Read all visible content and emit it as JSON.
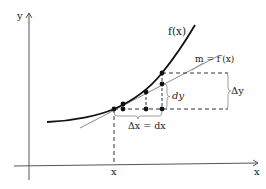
{
  "diagram": {
    "type": "calculus-differential-illustration",
    "axes": {
      "x_label": "x",
      "y_label": "y",
      "x_tick_label": "x"
    },
    "curve": {
      "label": "f(x)",
      "color": "#111111"
    },
    "tangent": {
      "label": "m = f′(x)",
      "color": "#888888"
    },
    "annotations": {
      "dy_label": "dy",
      "delta_y_label": "Δy",
      "delta_x_label": "Δx = dx"
    },
    "points": [
      {
        "id": "base",
        "x": 114,
        "y": 109
      },
      {
        "id": "curve-1",
        "x": 123,
        "y": 104
      },
      {
        "id": "base-1",
        "x": 123,
        "y": 109
      },
      {
        "id": "tangent-2",
        "x": 146,
        "y": 92
      },
      {
        "id": "base-2",
        "x": 146,
        "y": 109
      },
      {
        "id": "curve-top",
        "x": 162,
        "y": 73
      },
      {
        "id": "tangent-top",
        "x": 162,
        "y": 84
      },
      {
        "id": "base-3",
        "x": 162,
        "y": 109
      }
    ]
  }
}
